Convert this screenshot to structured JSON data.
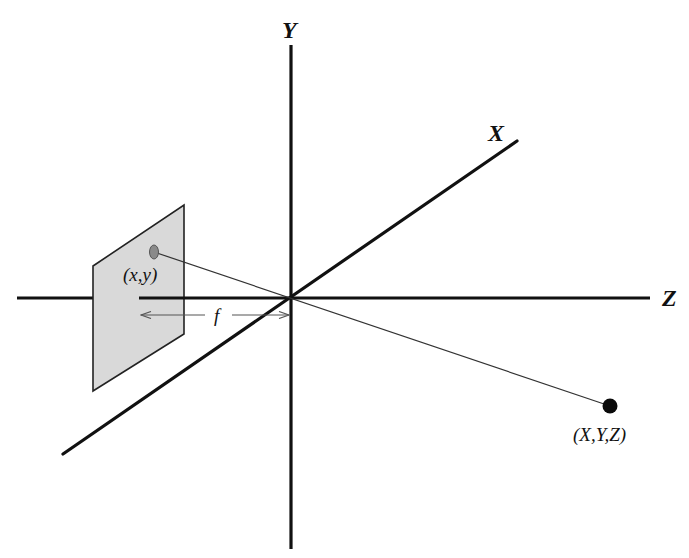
{
  "diagram": {
    "axes": {
      "x_label": "X",
      "y_label": "Y",
      "z_label": "Z"
    },
    "image_point": {
      "label": "(x,y)"
    },
    "world_point": {
      "label": "(X,Y,Z)"
    },
    "focal_length": {
      "label": "f"
    },
    "colors": {
      "axis": "#111111",
      "image_plane_fill": "#d9d9d9",
      "image_plane_stroke": "#222222",
      "ray": "#333333",
      "image_point": "#8a8a8a",
      "world_point": "#0a0a0a"
    }
  }
}
